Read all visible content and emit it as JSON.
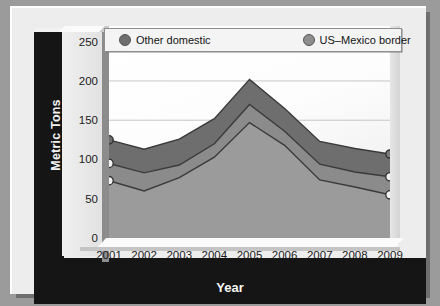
{
  "chart_data": {
    "type": "area",
    "stacked": true,
    "title": "",
    "xlabel": "Year",
    "ylabel": "Metric Tons",
    "categories": [
      "2001",
      "2002",
      "2003",
      "2004",
      "2005",
      "2006",
      "2007",
      "2008",
      "2009"
    ],
    "x_tick_labels": [
      "2001",
      "2002",
      "2003",
      "2004",
      "2005",
      "2006",
      "2007",
      "2008",
      "2009"
    ],
    "y_tick_labels": [
      "0",
      "50",
      "100",
      "150",
      "200",
      "250"
    ],
    "y_ticks": [
      0,
      50,
      100,
      150,
      200,
      250
    ],
    "ylim": [
      0,
      270
    ],
    "grid": true,
    "legend_position": "top",
    "series": [
      {
        "name": "At sea",
        "color": "#9a9a9a",
        "values": [
          73,
          60,
          77,
          103,
          147,
          118,
          74,
          65,
          55
        ]
      },
      {
        "name": "US–Mexico border",
        "color": "#8e8e8e",
        "values": [
          22,
          23,
          16,
          17,
          23,
          18,
          20,
          19,
          23
        ]
      },
      {
        "name": "Other domestic",
        "color": "#6e6e6e",
        "values": [
          30,
          30,
          33,
          32,
          32,
          29,
          29,
          30,
          29
        ]
      }
    ],
    "cumulative": {
      "at_sea": [
        73,
        60,
        77,
        103,
        147,
        118,
        74,
        65,
        55
      ],
      "us_mexico_border_top": [
        95,
        83,
        93,
        120,
        170,
        136,
        94,
        84,
        78
      ],
      "other_domestic_top": [
        125,
        113,
        126,
        152,
        202,
        165,
        123,
        114,
        107
      ]
    },
    "markers_shown_at": [
      "2001",
      "2009"
    ]
  },
  "legend": {
    "items": [
      {
        "label": "Other domestic",
        "color": "#6e6e6e"
      },
      {
        "label": "US–Mexico border",
        "color": "#8e8e8e"
      },
      {
        "label": "At sea",
        "color": "#a6a6a6"
      }
    ]
  },
  "axes": {
    "y_title": "Metric Tons",
    "x_title": "Year"
  }
}
